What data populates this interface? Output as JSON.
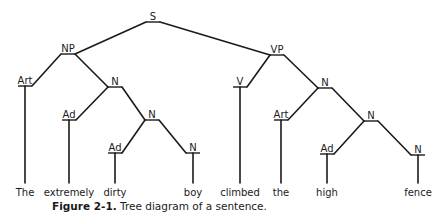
{
  "caption": {
    "label": "Figure 2-1.",
    "text": " Tree diagram of a sentence."
  },
  "tree": {
    "nodes": [
      {
        "id": "S",
        "label": "S",
        "x": 153,
        "y": 22
      },
      {
        "id": "NP",
        "label": "NP",
        "x": 68,
        "y": 54
      },
      {
        "id": "VP",
        "label": "VP",
        "x": 277,
        "y": 55
      },
      {
        "id": "Art1",
        "label": "Art",
        "x": 25,
        "y": 86
      },
      {
        "id": "N1",
        "label": "N",
        "x": 115,
        "y": 87
      },
      {
        "id": "Ad1",
        "label": "Ad",
        "x": 69,
        "y": 120
      },
      {
        "id": "N2",
        "label": "N",
        "x": 152,
        "y": 120
      },
      {
        "id": "Ad2",
        "label": "Ad",
        "x": 115,
        "y": 153
      },
      {
        "id": "N3",
        "label": "N",
        "x": 193,
        "y": 153
      },
      {
        "id": "V",
        "label": "V",
        "x": 240,
        "y": 87
      },
      {
        "id": "N4",
        "label": "N",
        "x": 325,
        "y": 88
      },
      {
        "id": "Art2",
        "label": "Art",
        "x": 281,
        "y": 120
      },
      {
        "id": "N5",
        "label": "N",
        "x": 371,
        "y": 121
      },
      {
        "id": "Ad3",
        "label": "Ad",
        "x": 327,
        "y": 154
      },
      {
        "id": "N6",
        "label": "N",
        "x": 418,
        "y": 155
      }
    ],
    "edges": [
      [
        "S",
        "NP"
      ],
      [
        "S",
        "VP"
      ],
      [
        "NP",
        "Art1"
      ],
      [
        "NP",
        "N1"
      ],
      [
        "N1",
        "Ad1"
      ],
      [
        "N1",
        "N2"
      ],
      [
        "N2",
        "Ad2"
      ],
      [
        "N2",
        "N3"
      ],
      [
        "VP",
        "V"
      ],
      [
        "VP",
        "N4"
      ],
      [
        "N4",
        "Art2"
      ],
      [
        "N4",
        "N5"
      ],
      [
        "N5",
        "Ad3"
      ],
      [
        "N5",
        "N6"
      ]
    ],
    "words": [
      {
        "text": "The",
        "node": "Art1"
      },
      {
        "text": "extremely",
        "node": "Ad1"
      },
      {
        "text": "dirty",
        "node": "Ad2"
      },
      {
        "text": "boy",
        "node": "N3"
      },
      {
        "text": "climbed",
        "node": "V"
      },
      {
        "text": "the",
        "node": "Art2"
      },
      {
        "text": "high",
        "node": "Ad3"
      },
      {
        "text": "fence",
        "node": "N6"
      }
    ]
  }
}
